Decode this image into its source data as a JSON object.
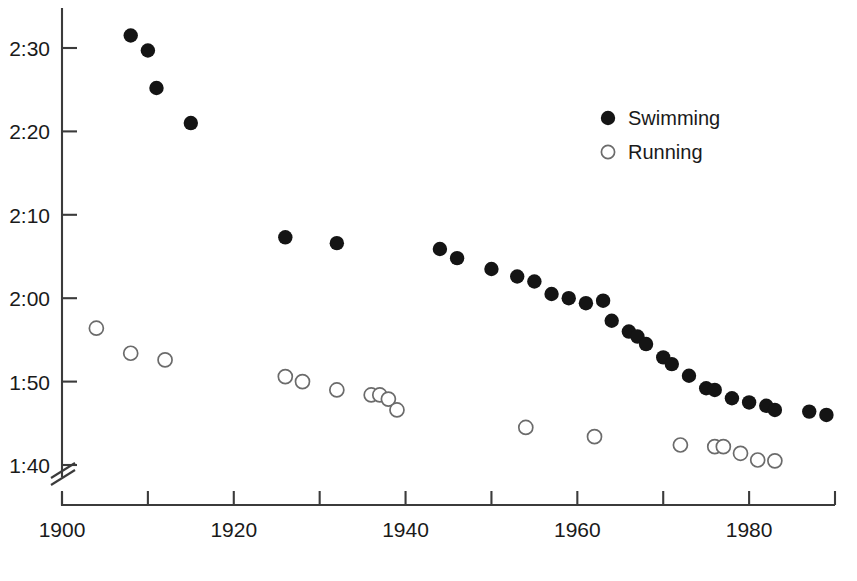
{
  "chart_data": {
    "type": "scatter",
    "title": "",
    "subtitle": "",
    "xlabel": "",
    "ylabel": "",
    "xlim": [
      1900,
      1990
    ],
    "ylim_seconds": [
      100,
      150
    ],
    "grid": false,
    "y_tick_labels": [
      "2:30",
      "2:20",
      "2:10",
      "2:00",
      "1:50",
      "1:40"
    ],
    "y_tick_seconds": [
      150,
      140,
      130,
      120,
      110,
      100
    ],
    "x_tick_labels": [
      "1900",
      "1920",
      "1940",
      "1960",
      "1980"
    ],
    "x_tick_values": [
      1900,
      1920,
      1940,
      1960,
      1980
    ],
    "x_minor_ticks": [
      1910,
      1930,
      1950,
      1970,
      1990
    ],
    "axis_break": {
      "axis": "y",
      "below_label": "1:40",
      "style": "double-slash"
    },
    "legend": {
      "position": "upper-right",
      "entries": [
        {
          "name": "Swimming",
          "marker": "filled-circle",
          "color": "#141414"
        },
        {
          "name": "Running",
          "marker": "open-circle",
          "color": "#ffffff"
        }
      ]
    },
    "series": [
      {
        "name": "Swimming",
        "marker": "filled-circle",
        "color": "#141414",
        "points": [
          {
            "x": 1908,
            "y_seconds": 151.5,
            "y_label": "2:31.5"
          },
          {
            "x": 1910,
            "y_seconds": 149.7,
            "y_label": "2:29.7"
          },
          {
            "x": 1911,
            "y_seconds": 145.2,
            "y_label": "2:25.2"
          },
          {
            "x": 1915,
            "y_seconds": 141.0,
            "y_label": "2:21.0"
          },
          {
            "x": 1926,
            "y_seconds": 127.3,
            "y_label": "2:07.3"
          },
          {
            "x": 1932,
            "y_seconds": 126.6,
            "y_label": "2:06.6"
          },
          {
            "x": 1944,
            "y_seconds": 125.9,
            "y_label": "2:05.9"
          },
          {
            "x": 1946,
            "y_seconds": 124.8,
            "y_label": "2:04.8"
          },
          {
            "x": 1950,
            "y_seconds": 123.5,
            "y_label": "2:03.5"
          },
          {
            "x": 1953,
            "y_seconds": 122.6,
            "y_label": "2:02.6"
          },
          {
            "x": 1955,
            "y_seconds": 122.0,
            "y_label": "2:02.0"
          },
          {
            "x": 1957,
            "y_seconds": 120.5,
            "y_label": "2:00.5"
          },
          {
            "x": 1959,
            "y_seconds": 120.0,
            "y_label": "2:00.0"
          },
          {
            "x": 1961,
            "y_seconds": 119.4,
            "y_label": "1:59.4"
          },
          {
            "x": 1963,
            "y_seconds": 119.7,
            "y_label": "1:59.7"
          },
          {
            "x": 1964,
            "y_seconds": 117.3,
            "y_label": "1:57.3"
          },
          {
            "x": 1966,
            "y_seconds": 116.0,
            "y_label": "1:56.0"
          },
          {
            "x": 1967,
            "y_seconds": 115.4,
            "y_label": "1:55.4"
          },
          {
            "x": 1968,
            "y_seconds": 114.5,
            "y_label": "1:54.5"
          },
          {
            "x": 1970,
            "y_seconds": 112.9,
            "y_label": "1:52.9"
          },
          {
            "x": 1971,
            "y_seconds": 112.1,
            "y_label": "1:52.1"
          },
          {
            "x": 1973,
            "y_seconds": 110.7,
            "y_label": "1:50.7"
          },
          {
            "x": 1975,
            "y_seconds": 109.2,
            "y_label": "1:49.2"
          },
          {
            "x": 1976,
            "y_seconds": 109.0,
            "y_label": "1:49.0"
          },
          {
            "x": 1978,
            "y_seconds": 108.0,
            "y_label": "1:48.0"
          },
          {
            "x": 1980,
            "y_seconds": 107.5,
            "y_label": "1:47.5"
          },
          {
            "x": 1982,
            "y_seconds": 107.1,
            "y_label": "1:47.1"
          },
          {
            "x": 1983,
            "y_seconds": 106.6,
            "y_label": "1:46.6"
          },
          {
            "x": 1987,
            "y_seconds": 106.4,
            "y_label": "1:46.4"
          },
          {
            "x": 1989,
            "y_seconds": 106.0,
            "y_label": "1:46.0"
          }
        ]
      },
      {
        "name": "Running",
        "marker": "open-circle",
        "color": "#ffffff",
        "points": [
          {
            "x": 1904,
            "y_seconds": 116.4,
            "y_label": "1:56.4"
          },
          {
            "x": 1908,
            "y_seconds": 113.4,
            "y_label": "1:53.4"
          },
          {
            "x": 1912,
            "y_seconds": 112.6,
            "y_label": "1:52.6"
          },
          {
            "x": 1926,
            "y_seconds": 110.6,
            "y_label": "1:50.6"
          },
          {
            "x": 1928,
            "y_seconds": 110.0,
            "y_label": "1:50.0"
          },
          {
            "x": 1932,
            "y_seconds": 109.0,
            "y_label": "1:49.0"
          },
          {
            "x": 1936,
            "y_seconds": 108.4,
            "y_label": "1:48.4"
          },
          {
            "x": 1937,
            "y_seconds": 108.4,
            "y_label": "1:48.4"
          },
          {
            "x": 1938,
            "y_seconds": 107.9,
            "y_label": "1:47.9"
          },
          {
            "x": 1939,
            "y_seconds": 106.6,
            "y_label": "1:46.6"
          },
          {
            "x": 1954,
            "y_seconds": 104.5,
            "y_label": "1:44.5"
          },
          {
            "x": 1962,
            "y_seconds": 103.4,
            "y_label": "1:43.4"
          },
          {
            "x": 1972,
            "y_seconds": 102.4,
            "y_label": "1:42.4"
          },
          {
            "x": 1976,
            "y_seconds": 102.2,
            "y_label": "1:42.2"
          },
          {
            "x": 1977,
            "y_seconds": 102.2,
            "y_label": "1:42.2"
          },
          {
            "x": 1979,
            "y_seconds": 101.4,
            "y_label": "1:41.4"
          },
          {
            "x": 1981,
            "y_seconds": 100.6,
            "y_label": "1:40.6"
          },
          {
            "x": 1983,
            "y_seconds": 100.5,
            "y_label": "1:40.5"
          }
        ]
      }
    ]
  }
}
